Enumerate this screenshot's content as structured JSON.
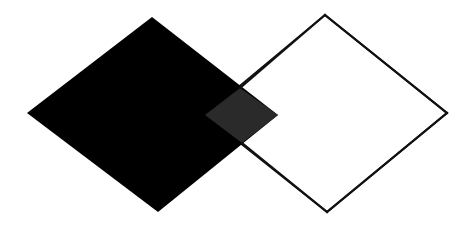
{
  "canvas": {
    "width": 476,
    "height": 228,
    "background_color": "#ffffff",
    "title": "Two overlapping rotated squares"
  },
  "palette": {
    "background": "#ffffff",
    "filled_square_fill": "#000000",
    "outlined_square_fill": "#ffffff",
    "outlined_square_stroke": "#111111",
    "overlap_fill": "#2a2a2a"
  },
  "shapes": [
    {
      "id": "filled-diamond",
      "name": "filled-black-square",
      "type": "polygon",
      "role": "solid filled rotated square on the left",
      "fill": "#000000",
      "stroke": "none",
      "stroke_width": 0,
      "points": "152,17 278,115 158,212 27,113",
      "vertices": [
        {
          "label": "top",
          "x": 152,
          "y": 17
        },
        {
          "label": "right",
          "x": 278,
          "y": 115
        },
        {
          "label": "bottom",
          "x": 158,
          "y": 212
        },
        {
          "label": "left",
          "x": 27,
          "y": 113
        }
      ]
    },
    {
      "id": "outlined-diamond",
      "name": "outlined-white-square",
      "type": "polygon",
      "role": "white rotated square with thin black outline on the right",
      "fill": "#ffffff",
      "stroke": "#111111",
      "stroke_width": 2,
      "points": "325,15 447,113 327,212 205,115",
      "vertices": [
        {
          "label": "top",
          "x": 325,
          "y": 15
        },
        {
          "label": "right",
          "x": 447,
          "y": 113
        },
        {
          "label": "bottom",
          "x": 327,
          "y": 212
        },
        {
          "label": "left",
          "x": 205,
          "y": 115
        }
      ]
    },
    {
      "id": "overlap-diamond",
      "name": "overlap-region",
      "type": "polygon",
      "role": "intersection of the two squares, rendered dark gray",
      "fill": "#2a2a2a",
      "stroke": "none",
      "stroke_width": 0,
      "points": "205,115 240,88 278,115 242,143",
      "vertices": [
        {
          "label": "left",
          "x": 205,
          "y": 115
        },
        {
          "label": "top",
          "x": 240,
          "y": 88
        },
        {
          "label": "right",
          "x": 278,
          "y": 115
        },
        {
          "label": "bottom",
          "x": 242,
          "y": 143
        }
      ]
    }
  ],
  "outline_segments": [
    {
      "id": "outline-top-right",
      "name": "outline-edge-top-right",
      "x1": 325,
      "y1": 15,
      "x2": 447,
      "y2": 113
    },
    {
      "id": "outline-bottom-right",
      "name": "outline-edge-bottom-right",
      "x1": 447,
      "y1": 113,
      "x2": 327,
      "y2": 212
    },
    {
      "id": "outline-bottom-left",
      "name": "outline-edge-bottom-left",
      "x1": 327,
      "y1": 212,
      "x2": 242,
      "y2": 143
    },
    {
      "id": "outline-top-left",
      "name": "outline-edge-top-left",
      "x1": 240,
      "y1": 88,
      "x2": 325,
      "y2": 15
    }
  ],
  "alt_text": "Abstract figure: a solid black rotated square overlapping a white rotated square outlined in black; the overlapping region appears dark gray."
}
